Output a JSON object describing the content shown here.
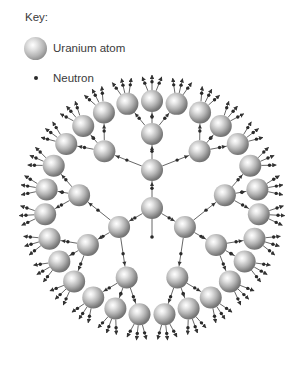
{
  "key": {
    "title": "Key:",
    "items": [
      {
        "symbol": "uranium-atom",
        "label": "Uranium atom"
      },
      {
        "symbol": "neutron",
        "label": "Neutron"
      }
    ]
  },
  "diagram": {
    "center": [
      152,
      208
    ],
    "levels": [
      {
        "name": "initial-atom",
        "count": 1,
        "radius": 0
      },
      {
        "name": "generation-1",
        "count": 3,
        "radius": 38,
        "angles_deg": [
          -90,
          150,
          30
        ]
      },
      {
        "name": "generation-2",
        "count": 9,
        "radius": 74,
        "spread_deg": 40
      },
      {
        "name": "generation-3",
        "count": 27,
        "radius": 107,
        "spread_deg": 13.3
      }
    ],
    "atom_radius": 11,
    "outgoing_neutrons_per_outer_atom": 3,
    "neutrons_per_fission": 3,
    "incoming_neutron_stub": true,
    "colors": {
      "atom_highlight": "#ffffff",
      "atom_mid": "#b4b4b4",
      "atom_shadow": "#6a6a6a",
      "neutron": "#2a2a2a",
      "arrow": "#333333",
      "line": "#555555"
    }
  }
}
